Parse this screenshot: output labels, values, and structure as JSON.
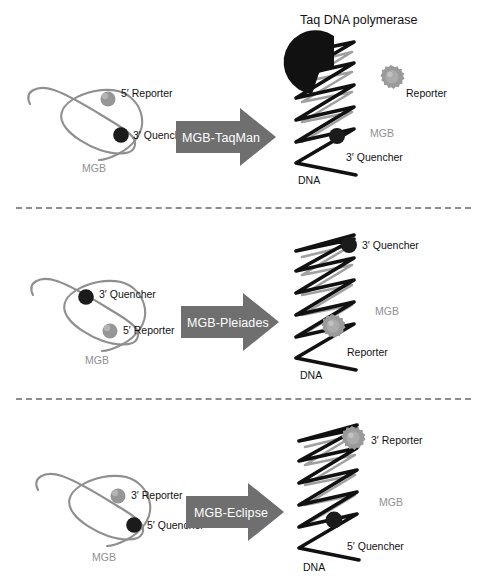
{
  "figure": {
    "colors": {
      "black": "#111111",
      "gray_probe": "#8f8f8f",
      "gray_light": "#a8a8a8",
      "arrow_gray": "#6f6f6f",
      "divider_gray": "#8d8d8d",
      "background": "#ffffff"
    },
    "dividers": [
      {
        "name": "divider-panel1-panel2"
      },
      {
        "name": "divider-panel2-panel3"
      }
    ]
  },
  "panels": [
    {
      "id": "taqman",
      "arrow_label": "MGB-TaqMan",
      "free_probe": {
        "mgb_label": "MGB",
        "labels": [
          {
            "text": "5′ Reporter",
            "marker": "circle-gray"
          },
          {
            "text": "3′ Quencher",
            "marker": "circle-black"
          }
        ]
      },
      "bound": {
        "enzyme_label": "Taq DNA polymerase",
        "dna_label": "DNA",
        "mgb_label": "MGB",
        "labels": [
          {
            "text": "3′ Quencher",
            "marker": "circle-black"
          },
          {
            "text": "Reporter",
            "marker": "starburst-gray"
          }
        ]
      }
    },
    {
      "id": "pleiades",
      "arrow_label": "MGB-Pleiades",
      "free_probe": {
        "mgb_label": "MGB",
        "labels": [
          {
            "text": "3′ Quencher",
            "marker": "circle-black"
          },
          {
            "text": "5′ Reporter",
            "marker": "circle-gray"
          }
        ]
      },
      "bound": {
        "dna_label": "DNA",
        "mgb_label": "MGB",
        "labels": [
          {
            "text": "3′ Quencher",
            "marker": "circle-black"
          },
          {
            "text": "Reporter",
            "marker": "starburst-gray"
          }
        ]
      }
    },
    {
      "id": "eclipse",
      "arrow_label": "MGB-Eclipse",
      "free_probe": {
        "mgb_label": "MGB",
        "labels": [
          {
            "text": "3′ Reporter",
            "marker": "circle-gray"
          },
          {
            "text": "5′ Quencher",
            "marker": "circle-black"
          }
        ]
      },
      "bound": {
        "dna_label": "DNA",
        "mgb_label": "MGB",
        "labels": [
          {
            "text": "3′ Reporter",
            "marker": "starburst-gray"
          },
          {
            "text": "5′ Quencher",
            "marker": "circle-black"
          }
        ]
      }
    }
  ]
}
